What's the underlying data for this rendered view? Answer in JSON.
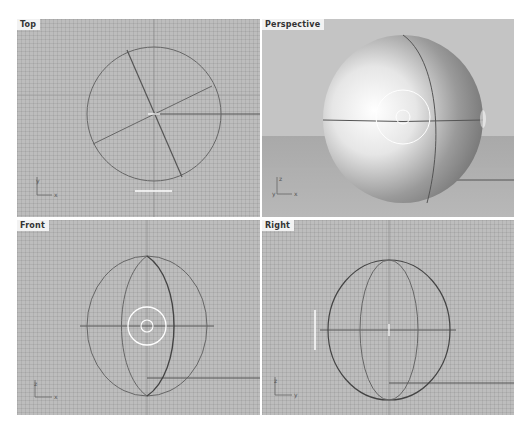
{
  "viewports": [
    {
      "name": "top",
      "label": "Top",
      "axes": {
        "vertical": "y",
        "horizontal": "x"
      }
    },
    {
      "name": "perspective",
      "label": "Perspective",
      "axes": {
        "vertical": "z",
        "horizontal": "x",
        "origin": "y"
      }
    },
    {
      "name": "front",
      "label": "Front",
      "axes": {
        "vertical": "z",
        "horizontal": "x"
      }
    },
    {
      "name": "right",
      "label": "Right",
      "axes": {
        "vertical": "z",
        "horizontal": "y"
      }
    }
  ],
  "colors": {
    "grid_background": "#bdbdbd",
    "curve": "#555555",
    "highlight": "#ffffff",
    "label_background": "#f2f2f2"
  }
}
